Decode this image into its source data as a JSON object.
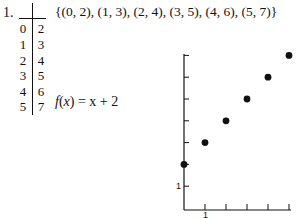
{
  "problem_number": "1.",
  "table": {
    "rows": [
      {
        "x": "0",
        "y": "2"
      },
      {
        "x": "1",
        "y": "3"
      },
      {
        "x": "2",
        "y": "4"
      },
      {
        "x": "3",
        "y": "5"
      },
      {
        "x": "4",
        "y": "6"
      },
      {
        "x": "5",
        "y": "7"
      }
    ]
  },
  "set_notation": "{(0, 2), (1, 3), (2, 4), (3, 5), (4, 6), (5, 7)}",
  "function": {
    "name": "f",
    "var": "x",
    "rhs": "= x + 2"
  },
  "chart_data": {
    "type": "scatter",
    "title": "",
    "xlabel": "",
    "ylabel": "",
    "x": [
      0,
      1,
      2,
      3,
      4,
      5
    ],
    "y": [
      2,
      3,
      4,
      5,
      6,
      7
    ],
    "x_tick_labels": [
      {
        "value": 1,
        "label": "1"
      }
    ],
    "y_tick_labels": [
      {
        "value": 1,
        "label": "1"
      }
    ],
    "xlim": [
      0,
      5
    ],
    "ylim": [
      0,
      7
    ],
    "grid": false,
    "legend": "none"
  }
}
